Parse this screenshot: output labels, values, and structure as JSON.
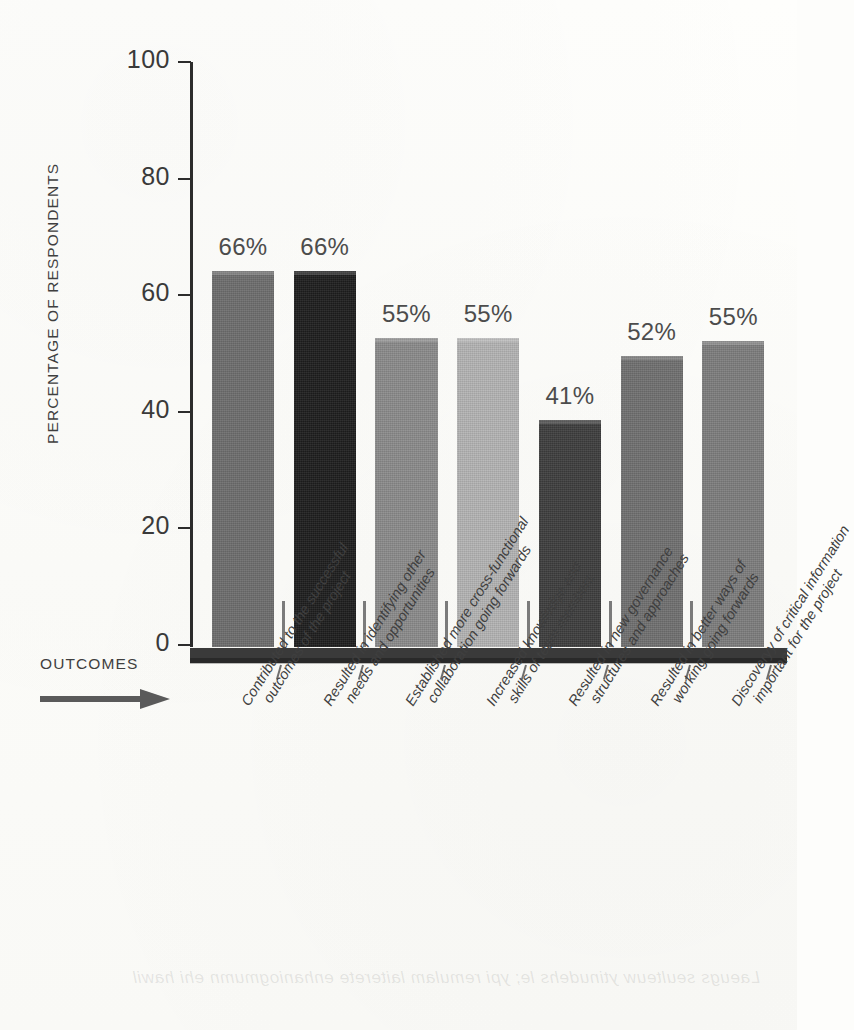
{
  "chart_data": {
    "type": "bar",
    "title": "",
    "subtitle": "",
    "xlabel": "OUTCOMES",
    "ylabel": "PERCENTAGE OF RESPONDENTS",
    "ylim": [
      0,
      100
    ],
    "yticks": [
      "0",
      "20",
      "40",
      "60",
      "80",
      "100"
    ],
    "grid": false,
    "legend": "none",
    "orientation": "vertical",
    "categories": [
      "Contributed to the successful outcomes of the project",
      "Resulted in identifying other needs and opportunities",
      "Established more cross-functional collaboration going forwards",
      "Increased knowledge and skills of team members",
      "Resulted in new governance structures and approaches",
      "Resulted in better ways of working going forwards",
      "Discoveryy of critical information important for the project"
    ],
    "values": [
      66,
      66,
      55,
      55,
      41,
      52,
      55
    ],
    "data_labels": [
      "66%",
      "66%",
      "55%",
      "55%",
      "41%",
      "52%",
      "55%"
    ],
    "drawn_heights": [
      64.5,
      64.5,
      53,
      53,
      39,
      50,
      52.5
    ],
    "bar_colors": [
      "#6d6d6d",
      "#1d1d1d",
      "#8a8a8a",
      "#b3b3b3",
      "#3d3d3d",
      "#6f6f6f",
      "#7d7d7d"
    ],
    "axis_color": "#2c2c2c",
    "text_color": "#3f3f3f"
  },
  "axis": {
    "y_title": "PERCENTAGE OF RESPONDENTS",
    "ticks": [
      {
        "label": "100",
        "value": 100
      },
      {
        "label": "80",
        "value": 80
      },
      {
        "label": "60",
        "value": 60
      },
      {
        "label": "40",
        "value": 40
      },
      {
        "label": "20",
        "value": 20
      },
      {
        "label": "0",
        "value": 0
      }
    ]
  },
  "xaxis_caption": {
    "label": "OUTCOMES",
    "arrow_icon": "right-arrow-icon"
  },
  "xlabels": [
    {
      "line1": "Contributed to the successful",
      "line2": "outcomes of the project"
    },
    {
      "line1": "Resulted in identifying other",
      "line2": "needs and opportunities"
    },
    {
      "line1": "Established more cross-functional",
      "line2": "collaboration going forwards"
    },
    {
      "line1": "Increased knowledge and",
      "line2": "skills of team members"
    },
    {
      "line1": "Resulted in new governance",
      "line2": "structures and approaches"
    },
    {
      "line1": "Resulted in better ways of",
      "line2": "working going forwards"
    },
    {
      "line1": "Discoveryy of critical information",
      "line2": "important for the project"
    }
  ],
  "ghost_text": "Laeugs seulteuw ytinudehs le; ypi remulam laiterete enhaniogmumn ehi hawil"
}
